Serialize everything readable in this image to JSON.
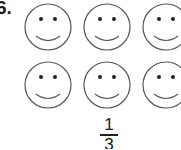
{
  "question": {
    "number": "6."
  },
  "faces": {
    "count": 6,
    "rows": 2,
    "columns": 3,
    "icon": "smiley-face-icon",
    "stroke_color": "#555555"
  },
  "answer_fraction": {
    "numerator": "1",
    "denominator": "3"
  }
}
